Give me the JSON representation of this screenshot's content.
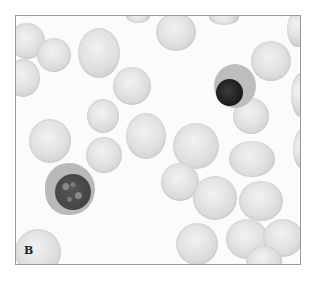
{
  "figure": {
    "panel_label": "B",
    "caption_visible_fragment": "图 ... (caption text cut off / illegible)"
  },
  "cells": [
    {
      "type": "rbc",
      "x": 8,
      "y": 22,
      "w": 36,
      "h": 36
    },
    {
      "type": "rbc",
      "x": 5,
      "y": 58,
      "w": 34,
      "h": 38
    },
    {
      "type": "rbc",
      "x": 36,
      "y": 37,
      "w": 34,
      "h": 34
    },
    {
      "type": "rbc",
      "x": 77,
      "y": 27,
      "w": 42,
      "h": 50
    },
    {
      "type": "rbc",
      "x": 125,
      "y": 8,
      "w": 24,
      "h": 14
    },
    {
      "type": "rbc",
      "x": 155,
      "y": 12,
      "w": 40,
      "h": 38
    },
    {
      "type": "rbc",
      "x": 208,
      "y": 8,
      "w": 30,
      "h": 16
    },
    {
      "type": "rbc",
      "x": 250,
      "y": 40,
      "w": 40,
      "h": 40
    },
    {
      "type": "rbc",
      "x": 286,
      "y": 10,
      "w": 20,
      "h": 36
    },
    {
      "type": "rbc",
      "x": 112,
      "y": 66,
      "w": 38,
      "h": 38
    },
    {
      "type": "rbc",
      "x": 86,
      "y": 98,
      "w": 32,
      "h": 34
    },
    {
      "type": "rbc",
      "x": 28,
      "y": 118,
      "w": 42,
      "h": 44
    },
    {
      "type": "rbc",
      "x": 125,
      "y": 112,
      "w": 40,
      "h": 46
    },
    {
      "type": "rbc",
      "x": 172,
      "y": 122,
      "w": 46,
      "h": 46
    },
    {
      "type": "rbc",
      "x": 228,
      "y": 140,
      "w": 46,
      "h": 36
    },
    {
      "type": "rbc",
      "x": 85,
      "y": 136,
      "w": 36,
      "h": 36
    },
    {
      "type": "rbc",
      "x": 232,
      "y": 97,
      "w": 36,
      "h": 36
    },
    {
      "type": "rbc",
      "x": 290,
      "y": 72,
      "w": 20,
      "h": 44
    },
    {
      "type": "rbc",
      "x": 292,
      "y": 128,
      "w": 20,
      "h": 40
    },
    {
      "type": "rbc",
      "x": 160,
      "y": 162,
      "w": 38,
      "h": 38
    },
    {
      "type": "rbc",
      "x": 192,
      "y": 175,
      "w": 44,
      "h": 44
    },
    {
      "type": "rbc",
      "x": 238,
      "y": 180,
      "w": 44,
      "h": 40
    },
    {
      "type": "rbc",
      "x": 175,
      "y": 222,
      "w": 42,
      "h": 42
    },
    {
      "type": "rbc",
      "x": 225,
      "y": 218,
      "w": 42,
      "h": 40
    },
    {
      "type": "rbc",
      "x": 262,
      "y": 218,
      "w": 40,
      "h": 38
    },
    {
      "type": "rbc",
      "x": 245,
      "y": 245,
      "w": 36,
      "h": 30
    },
    {
      "type": "rbc",
      "x": 14,
      "y": 228,
      "w": 46,
      "h": 46
    }
  ]
}
